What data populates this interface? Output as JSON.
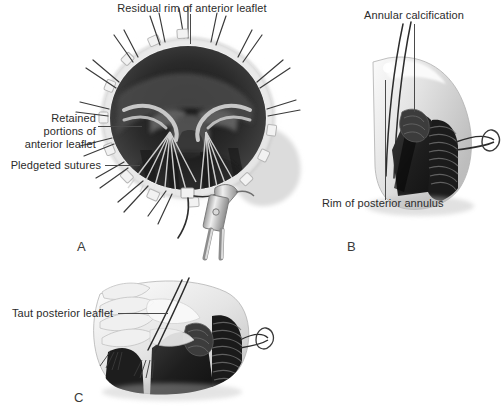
{
  "figure": {
    "type": "medical-illustration",
    "background_color": "#ffffff",
    "ink_color": "#2b2b2b",
    "palette": {
      "tissue_light": "#e9e9e9",
      "tissue_mid": "#b9b9b9",
      "tissue_shadow": "#8a8a8a",
      "cavity_dark": "#303030",
      "cavity_darkest": "#1c1c1c",
      "calcification": "#262626",
      "suture": "#555555",
      "instrument_metal": "#c8c8c8"
    }
  },
  "panels": [
    {
      "id": "A",
      "letter": "A",
      "labels": [
        {
          "name": "residual-rim-label",
          "lines": [
            "Residual rim of anterior leaflet"
          ],
          "align": "center"
        },
        {
          "name": "retained-portions-label",
          "lines": [
            "Retained",
            "portions of",
            "anterior leaflet"
          ],
          "align": "right"
        },
        {
          "name": "pledgeted-sutures-label",
          "lines": [
            "Pledgeted sutures"
          ],
          "align": "right"
        }
      ]
    },
    {
      "id": "B",
      "letter": "B",
      "labels": [
        {
          "name": "annular-calcification-label",
          "lines": [
            "Annular calcification"
          ],
          "align": "center"
        },
        {
          "name": "rim-posterior-annulus-label",
          "lines": [
            "Rim of posterior annulus"
          ],
          "align": "left"
        }
      ]
    },
    {
      "id": "C",
      "letter": "C",
      "labels": [
        {
          "name": "taut-posterior-leaflet-label",
          "lines": [
            "Taut posterior leaflet"
          ],
          "align": "left"
        }
      ]
    }
  ],
  "text": {
    "residual_rim": "Residual rim of anterior leaflet",
    "retained_1": "Retained",
    "retained_2": "portions of",
    "retained_3": "anterior leaflet",
    "pledgeted_sutures": "Pledgeted sutures",
    "annular_calcification": "Annular calcification",
    "rim_posterior_annulus": "Rim of posterior annulus",
    "taut_posterior_leaflet": "Taut posterior leaflet",
    "letter_a": "A",
    "letter_b": "B",
    "letter_c": "C"
  }
}
